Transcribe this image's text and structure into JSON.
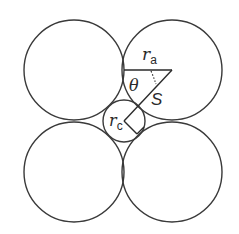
{
  "diagram": {
    "title": "",
    "colors": {
      "stroke": "#3a3a3a",
      "background": "#ffffff",
      "text": "#2a2a2a"
    },
    "large_circles": [
      {
        "name": "top-left",
        "cx": 74,
        "cy": 70,
        "r": 50
      },
      {
        "name": "top-right",
        "cx": 172,
        "cy": 70,
        "r": 50
      },
      {
        "name": "bottom-left",
        "cx": 74,
        "cy": 172,
        "r": 50
      },
      {
        "name": "bottom-right",
        "cx": 172,
        "cy": 172,
        "r": 50
      }
    ],
    "small_circle": {
      "cx": 124,
      "cy": 121,
      "r": 21
    },
    "labels": {
      "ra_main": "r",
      "ra_sub": "a",
      "theta": "θ",
      "s": "S",
      "rc_main": "r",
      "rc_sub": "c"
    }
  }
}
